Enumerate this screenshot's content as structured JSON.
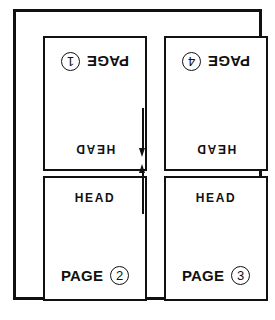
{
  "diagram": {
    "colors": {
      "ink": "#111111",
      "paper": "#ffffff"
    },
    "panels": [
      {
        "id": "top-left",
        "page_label": "PAGE",
        "page_number": "1",
        "head_label": "HEAD",
        "orientation": "upside-down"
      },
      {
        "id": "top-right",
        "page_label": "PAGE",
        "page_number": "4",
        "head_label": "HEAD",
        "orientation": "upside-down"
      },
      {
        "id": "bottom-left",
        "page_label": "PAGE",
        "page_number": "2",
        "head_label": "HEAD",
        "orientation": "upright"
      },
      {
        "id": "bottom-right",
        "page_label": "PAGE",
        "page_number": "3",
        "head_label": "HEAD",
        "orientation": "upright"
      }
    ],
    "arrows": [
      {
        "id": "gutter-arrow-down",
        "direction": "down"
      },
      {
        "id": "gutter-arrow-up",
        "direction": "up"
      }
    ]
  }
}
